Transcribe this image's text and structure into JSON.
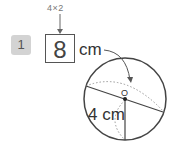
{
  "problem": {
    "number": "1",
    "hint": "4×2",
    "answer": "8",
    "unit": "cm",
    "radius_label": "4 cm",
    "center_label": "O"
  }
}
